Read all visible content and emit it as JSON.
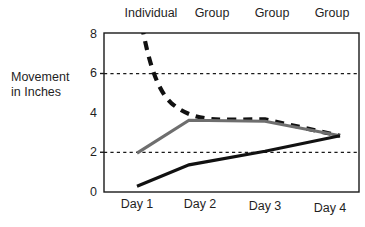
{
  "chart_data": {
    "type": "line",
    "title": "",
    "xlabel": "",
    "ylabel": "Movement in Inches",
    "ylabel_line1": "Movement",
    "ylabel_line2": "in Inches",
    "categories": [
      "Day 1",
      "Day 2",
      "Day 3",
      "Day 4"
    ],
    "xlim": [
      0.5,
      4.6
    ],
    "ylim": [
      0,
      8.2
    ],
    "yticks": [
      "0",
      "2",
      "4",
      "6",
      "8"
    ],
    "ytick_values": [
      0,
      2,
      4,
      6,
      8
    ],
    "gridlines": [
      2,
      6
    ],
    "grid": "horizontal-dotted",
    "legend": "none",
    "top_annotations": [
      "Individual",
      "Group",
      "Group",
      "Group"
    ],
    "series": [
      {
        "name": "dashed-curve",
        "style": "dashed",
        "color": "#111111",
        "values": [
          9.4,
          4.6,
          3.75,
          2.9
        ],
        "note": "starts above the plot area at Day 1, clipped at y=8.2"
      },
      {
        "name": "gray-line",
        "style": "solid",
        "color": "#6e6e6e",
        "values": [
          2.0,
          3.7,
          3.65,
          2.9
        ]
      },
      {
        "name": "black-line",
        "style": "solid",
        "color": "#111111",
        "values": [
          0.3,
          1.4,
          2.1,
          2.9
        ]
      }
    ]
  },
  "colors": {
    "axis": "#1a1a1a",
    "grid": "#1a1a1a",
    "background": "#ffffff",
    "dashed_series": "#111111",
    "gray_series": "#6e6e6e",
    "black_series": "#111111"
  }
}
